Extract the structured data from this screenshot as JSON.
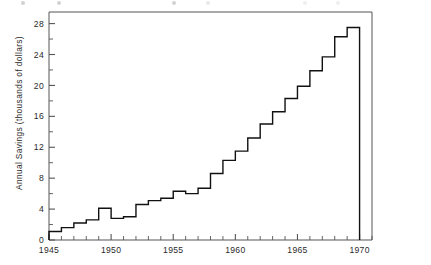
{
  "figure": {
    "name": "annual-savings-step-chart"
  },
  "chart_data": {
    "type": "line",
    "subtype": "step",
    "title": "",
    "xlabel": "",
    "ylabel": "Annual Savings (thousands of dollars)",
    "xlim": [
      1945,
      1971
    ],
    "ylim": [
      0,
      29.5
    ],
    "grid": false,
    "legend": null,
    "xticks": [
      1945,
      1946,
      1947,
      1948,
      1949,
      1950,
      1951,
      1952,
      1953,
      1954,
      1955,
      1956,
      1957,
      1958,
      1959,
      1960,
      1961,
      1962,
      1963,
      1964,
      1965,
      1966,
      1967,
      1968,
      1969,
      1970,
      1971
    ],
    "xticklabels": [
      "1945",
      "",
      "",
      "",
      "",
      "1950",
      "",
      "",
      "",
      "",
      "1955",
      "",
      "",
      "",
      "",
      "1960",
      "",
      "",
      "",
      "",
      "1965",
      "",
      "",
      "",
      "",
      "1970",
      ""
    ],
    "xtick_labeled_values": [
      1945,
      1950,
      1955,
      1960,
      1965,
      1970
    ],
    "yticks": [
      0,
      2,
      4,
      6,
      8,
      10,
      12,
      14,
      16,
      18,
      20,
      22,
      24,
      26,
      28
    ],
    "yticklabels": [
      "0",
      "",
      "4",
      "",
      "8",
      "",
      "12",
      "",
      "16",
      "",
      "20",
      "",
      "24",
      "",
      "28"
    ],
    "ytick_labeled_values": [
      0,
      4,
      8,
      12,
      16,
      20,
      24,
      28
    ],
    "x": [
      1945.5,
      1946.5,
      1947.5,
      1948.5,
      1949.5,
      1950.5,
      1951.5,
      1952.5,
      1953.5,
      1954.5,
      1955.5,
      1956.5,
      1957.5,
      1958.5,
      1959.5,
      1960.5,
      1961.5,
      1962.5,
      1963.5,
      1964.5,
      1965.5,
      1966.5,
      1967.5,
      1968.5,
      1969.5
    ],
    "values": [
      1.1,
      1.6,
      2.2,
      2.6,
      4.1,
      2.8,
      3.0,
      4.6,
      5.1,
      5.4,
      6.3,
      6.0,
      6.7,
      8.6,
      10.3,
      11.5,
      13.2,
      15.0,
      16.6,
      18.3,
      19.9,
      21.9,
      23.7,
      26.3,
      27.5
    ],
    "series_label": "Annual Savings",
    "line_color": "#111111",
    "line_width": 1.4,
    "drop_to_zero_at": 1969.5,
    "annotations": []
  },
  "axes": {
    "frame_visible": true,
    "frame_color": "#555555",
    "tick_direction": "in"
  }
}
